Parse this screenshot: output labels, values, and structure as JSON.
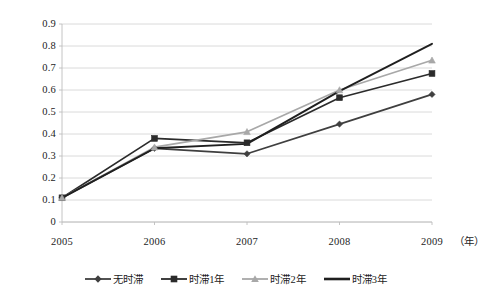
{
  "chart_data": {
    "type": "line",
    "title": "",
    "subtitle": "",
    "xlabel": "（年）",
    "ylabel": "",
    "x": [
      "2005",
      "2006",
      "2007",
      "2008",
      "2009"
    ],
    "categories": [
      "2005",
      "2006",
      "2007",
      "2008",
      "2009"
    ],
    "xlim": [
      "2005",
      "2009"
    ],
    "ylim": [
      0,
      0.9
    ],
    "ytick_labels": [
      "0.9",
      "0.8",
      "0.7",
      "0.6",
      "0.5",
      "0.4",
      "0.3",
      "0.2",
      "0.1",
      "0"
    ],
    "ytick_values": [
      0.9,
      0.8,
      0.7,
      0.6,
      0.5,
      0.4,
      0.3,
      0.2,
      0.1,
      0
    ],
    "grid": "horizontal",
    "legend_position": "bottom",
    "series": [
      {
        "name": "无时滞",
        "marker": "diamond",
        "color": "#3f3f3f",
        "values": [
          0.11,
          0.335,
          0.31,
          0.445,
          0.58
        ]
      },
      {
        "name": "时滞1年",
        "marker": "square",
        "color": "#2b2b2b",
        "values": [
          0.11,
          0.38,
          0.36,
          0.565,
          0.675
        ]
      },
      {
        "name": "时滞2年",
        "marker": "triangle",
        "color": "#a8a8a8",
        "values": [
          0.11,
          0.34,
          0.41,
          0.6,
          0.735
        ]
      },
      {
        "name": "时滞3年",
        "marker": "none",
        "color": "#1f1f1f",
        "values": [
          0.11,
          0.335,
          0.355,
          0.595,
          0.81
        ]
      }
    ]
  },
  "axis": {
    "y_labels": [
      "0.9",
      "0.8",
      "0.7",
      "0.6",
      "0.5",
      "0.4",
      "0.3",
      "0.2",
      "0.1",
      "0"
    ],
    "x_labels": [
      "2005",
      "2006",
      "2007",
      "2008",
      "2009"
    ],
    "x_unit": "（年）"
  },
  "legend": {
    "items": [
      {
        "label": "无时滞"
      },
      {
        "label": "时滞1年"
      },
      {
        "label": "时滞2年"
      },
      {
        "label": "时滞3年"
      }
    ]
  },
  "colors": {
    "grid": "#d0d0d0",
    "axis": "#bdbdbd",
    "background": "#ffffff",
    "series_1": "#3f3f3f",
    "series_2": "#2b2b2b",
    "series_3": "#a8a8a8",
    "series_4": "#1f1f1f"
  }
}
